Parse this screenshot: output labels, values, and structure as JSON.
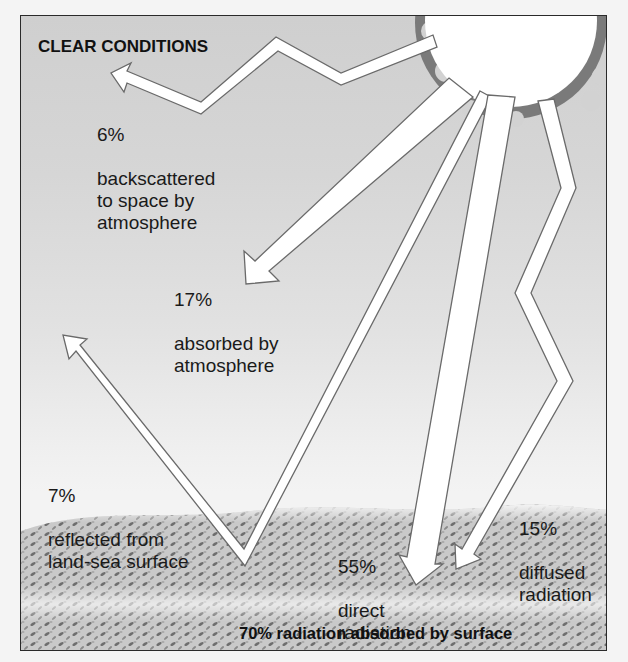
{
  "diagram": {
    "title": "CLEAR CONDITIONS",
    "footer": "70% radiation absorbed by surface",
    "colors": {
      "sky_top": "#cfcfcf",
      "sky_bottom": "#f3f3f3",
      "arrow_fill": "#ffffff",
      "arrow_stroke": "#6a6a6a",
      "sun_fill": "#ffffff",
      "sun_corona": "#777777",
      "ground": "#8a8a8a",
      "border": "#2a2a2a"
    },
    "flows": [
      {
        "id": "backscattered",
        "percent": "6%",
        "text": "backscattered\nto space by\natmosphere"
      },
      {
        "id": "absorbed-atmosphere",
        "percent": "17%",
        "text": "absorbed by\natmosphere"
      },
      {
        "id": "reflected",
        "percent": "7%",
        "text": "reflected from\nland-sea surface"
      },
      {
        "id": "direct",
        "percent": "55%",
        "text": "direct\nradiation"
      },
      {
        "id": "diffused",
        "percent": "15%",
        "text": "diffused\nradiation"
      }
    ]
  }
}
